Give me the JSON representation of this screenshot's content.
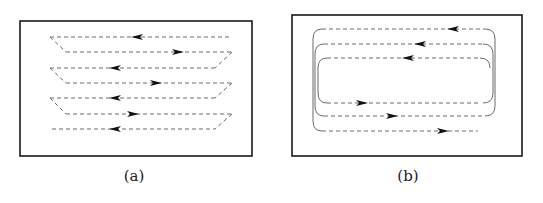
{
  "figure": {
    "panels": [
      {
        "id": "a",
        "caption": "(a)",
        "pattern": "zigzag-raster",
        "box": {
          "x": 20,
          "y": 21,
          "w": 232,
          "h": 135
        },
        "lines": [
          {
            "y": 37,
            "x1": 50,
            "x2": 232,
            "dir": "left",
            "arrow_x": 137
          },
          {
            "y": 52,
            "x1": 66,
            "x2": 232,
            "dir": "right",
            "arrow_x": 178
          },
          {
            "y": 68,
            "x1": 50,
            "x2": 215,
            "dir": "left",
            "arrow_x": 115
          },
          {
            "y": 83,
            "x1": 66,
            "x2": 232,
            "dir": "right",
            "arrow_x": 156
          },
          {
            "y": 98,
            "x1": 50,
            "x2": 215,
            "dir": "left",
            "arrow_x": 115
          },
          {
            "y": 114,
            "x1": 66,
            "x2": 232,
            "dir": "right",
            "arrow_x": 133
          },
          {
            "y": 129,
            "x1": 52,
            "x2": 215,
            "dir": "left",
            "arrow_x": 115
          }
        ],
        "caption_pos": {
          "x": 134,
          "y": 181
        }
      },
      {
        "id": "b",
        "caption": "(b)",
        "pattern": "nested-loop",
        "box": {
          "x": 292,
          "y": 15,
          "w": 230,
          "h": 141
        },
        "top_lines": [
          {
            "y": 29,
            "dir": "left",
            "arrow_x": 453
          },
          {
            "y": 44,
            "dir": "left",
            "arrow_x": 420
          },
          {
            "y": 58,
            "dir": "left",
            "arrow_x": 408
          }
        ],
        "bottom_lines": [
          {
            "y": 103,
            "dir": "right",
            "arrow_x": 362
          },
          {
            "y": 116,
            "dir": "right",
            "arrow_x": 392
          },
          {
            "y": 131,
            "dir": "right",
            "arrow_x": 443
          }
        ],
        "caption_pos": {
          "x": 408,
          "y": 181
        }
      }
    ]
  }
}
